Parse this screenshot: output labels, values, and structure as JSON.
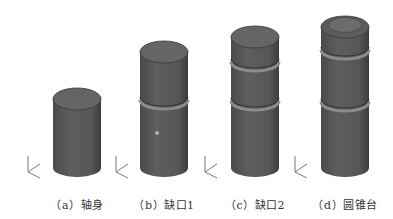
{
  "figure": {
    "panels": [
      {
        "id": "a",
        "label": "（a）轴身",
        "type": "plain-cylinder",
        "cx": 77,
        "top": 88,
        "notches": 0,
        "cone": false,
        "dot": false
      },
      {
        "id": "b",
        "label": "（b）缺口1",
        "type": "cylinder-one-notch",
        "cx": 164,
        "top": 41,
        "notches": 1,
        "cone": false,
        "dot": true
      },
      {
        "id": "c",
        "label": "（c）缺口2",
        "type": "cylinder-two-notches",
        "cx": 255,
        "top": 26,
        "notches": 2,
        "cone": false,
        "dot": false
      },
      {
        "id": "d",
        "label": "（d）圆锥台",
        "type": "cylinder-two-notches-conical-frustum",
        "cx": 345,
        "top": 15,
        "notches": 2,
        "cone": true,
        "dot": false
      }
    ],
    "axis_triad_label": "Z",
    "colors": {
      "body": "#5a5a5a",
      "body_dark": "#3e3e3e",
      "top_face": "#6a6a6a",
      "notch_highlight": "#8c8c8c",
      "caption": "#333333"
    }
  }
}
